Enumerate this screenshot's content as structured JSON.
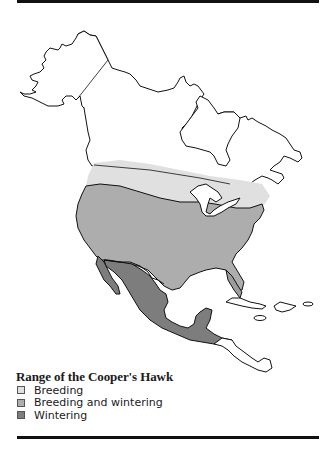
{
  "map": {
    "title": "Range of the Cooper's Hawk",
    "region": "North America",
    "legend": [
      {
        "label": "Breeding",
        "color": "#e0e0e0"
      },
      {
        "label": "Breeding and wintering",
        "color": "#adadad"
      },
      {
        "label": "Wintering",
        "color": "#7d7d7d"
      }
    ],
    "outline_color": "#111111",
    "background": "#ffffff"
  }
}
